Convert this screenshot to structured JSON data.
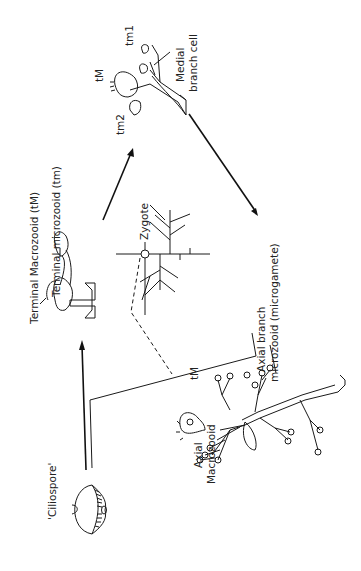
{
  "diagram": {
    "orientation": "rotated-90-ccw",
    "labels": {
      "ciliospore": "'Ciliospore'",
      "terminal_macrozooid": "Terminal Macrozooid (tM)",
      "terminal_microzooid": "Terminal microzooid (tm)",
      "tM_top": "tM",
      "tm1": "tm1",
      "tm2": "tm2",
      "medial_branch_cell_1": "Medial",
      "medial_branch_cell_2": "branch cell",
      "zygote": "Zygote",
      "axial_branch_1": "Axial branch",
      "axial_branch_2": "microzooid (microgamete)",
      "tM_colony": "tM",
      "axial_macrozooid_1": "Axial",
      "axial_macrozooid_2": "Macrozooid"
    },
    "nodes": [
      {
        "id": "ciliospore",
        "label": "'Ciliospore'"
      },
      {
        "id": "young-colony",
        "label": "Terminal Macrozooid (tM) / Terminal microzooid (tm)"
      },
      {
        "id": "branching-colony",
        "label": "Medial branch cell"
      },
      {
        "id": "mature-colony",
        "label": "Axial Macrozooid / Axial branch microzooid (microgamete)"
      },
      {
        "id": "zygote",
        "label": "Zygote"
      }
    ],
    "edges": [
      {
        "from": "ciliospore",
        "to": "young-colony",
        "style": "arrow"
      },
      {
        "from": "young-colony",
        "to": "branching-colony",
        "style": "arrow"
      },
      {
        "from": "branching-colony",
        "to": "mature-colony",
        "style": "arrow"
      },
      {
        "from": "mature-colony",
        "to": "zygote",
        "style": "dashed"
      },
      {
        "from": "mature-colony",
        "to": "ciliospore",
        "style": "line"
      }
    ]
  }
}
